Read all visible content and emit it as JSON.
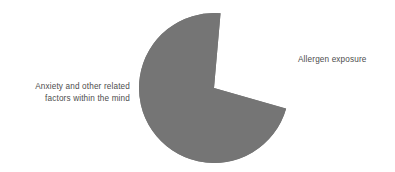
{
  "chart_data": {
    "type": "pie",
    "title": "",
    "subtitle": "",
    "xlabel": "",
    "ylabel": "",
    "grid": false,
    "legend_position": "outside-labels",
    "background_color": "#ffffff",
    "label_color": "#4d4d4d",
    "start_angle_deg": -85,
    "direction": "clockwise",
    "categories": [
      "Allergen exposure",
      "Anxiety and other related factors within the mind"
    ],
    "values": [
      28,
      72
    ],
    "value_unit": "percent",
    "slices": [
      {
        "label": "Allergen exposure",
        "label_lines": [
          "Allergen exposure"
        ],
        "value": 28,
        "color": "#dcdcdc",
        "angle_deg": 101,
        "label_side": "right"
      },
      {
        "label": "Anxiety and other related factors within the mind",
        "label_lines": [
          "Anxiety and other related",
          "factors within the mind"
        ],
        "value": 72,
        "color": "#757575",
        "angle_deg": 259,
        "label_side": "left"
      }
    ]
  },
  "labels": {
    "left_line1": "Anxiety and other related",
    "left_line2": "factors within the mind",
    "right_line1": "Allergen exposure"
  }
}
